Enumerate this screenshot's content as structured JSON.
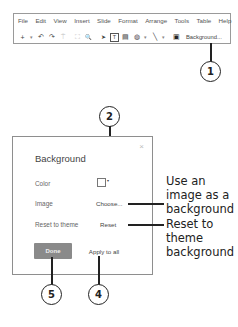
{
  "toolbar": {
    "menu": [
      "File",
      "Edit",
      "View",
      "Insert",
      "Slide",
      "Format",
      "Arrange",
      "Tools",
      "Table",
      "Help"
    ],
    "tools": [
      {
        "icon": "new-slide-icon",
        "glyph": "+"
      },
      {
        "icon": "dropdown-caret-icon",
        "glyph": "▾"
      },
      {
        "icon": "undo-icon",
        "glyph": "↶"
      },
      {
        "icon": "redo-icon",
        "glyph": "↷"
      },
      {
        "icon": "paint-format-icon",
        "glyph": "⍑"
      },
      {
        "icon": "zoom-fit-icon",
        "glyph": "⛶"
      },
      {
        "icon": "zoom-icon",
        "glyph": "🔍"
      },
      {
        "icon": "select-pointer-icon",
        "glyph": "➤"
      },
      {
        "icon": "text-box-icon",
        "glyph": "T"
      },
      {
        "icon": "image-icon",
        "glyph": "▤"
      },
      {
        "icon": "shape-icon",
        "glyph": "◍"
      },
      {
        "icon": "shape-caret-icon",
        "glyph": "▾"
      },
      {
        "icon": "line-icon",
        "glyph": "╲"
      },
      {
        "icon": "line-caret-icon",
        "glyph": "▾"
      },
      {
        "icon": "comment-icon",
        "glyph": "▣"
      }
    ],
    "background_button": "Background..."
  },
  "dialog": {
    "title": "Background",
    "close_glyph": "×",
    "color_label": "Color",
    "color_caret": "▾",
    "image_label": "Image",
    "choose_button": "Choose...",
    "reset_label": "Reset to theme",
    "reset_button": "Reset",
    "done_button": "Done",
    "apply_button": "Apply to all"
  },
  "callouts": {
    "c1": "1",
    "c2": "2",
    "c4": "4",
    "c5": "5",
    "image_note": [
      "Use an",
      "image as a",
      "background"
    ],
    "reset_note": [
      "Reset to",
      "theme",
      "background"
    ]
  }
}
